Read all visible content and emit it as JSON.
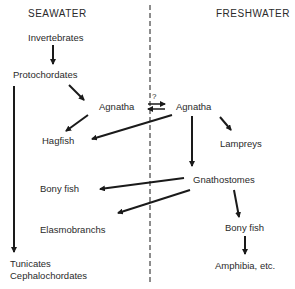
{
  "headers": {
    "left": "SEAWATER",
    "right": "FRESHWATER"
  },
  "nodes": {
    "invertebrates": "Invertebrates",
    "protochordates": "Protochordates",
    "agnatha_sea": "Agnatha",
    "agnatha_fresh": "Agnatha",
    "question": "?",
    "hagfish": "Hagfish",
    "lampreys": "Lampreys",
    "gnathostomes": "Gnathostomes",
    "bony_fish_sea": "Bony fish",
    "elasmobranchs": "Elasmobranchs",
    "bony_fish_fresh": "Bony fish",
    "amphibia": "Amphibia, etc.",
    "tunicates": "Tunicates",
    "cephalochordates": "Cephalochordates"
  },
  "edges": [
    {
      "from": "Invertebrates",
      "to": "Protochordates"
    },
    {
      "from": "Protochordates",
      "to": "Agnatha (seawater)"
    },
    {
      "from": "Protochordates",
      "to": "Tunicates / Cephalochordates"
    },
    {
      "from": "Agnatha (seawater)",
      "to": "Agnatha (freshwater)",
      "bidirectional": true,
      "label": "?"
    },
    {
      "from": "Agnatha (seawater)",
      "to": "Hagfish"
    },
    {
      "from": "Agnatha (freshwater)",
      "to": "Hagfish"
    },
    {
      "from": "Agnatha (freshwater)",
      "to": "Lampreys"
    },
    {
      "from": "Agnatha (freshwater)",
      "to": "Gnathostomes"
    },
    {
      "from": "Gnathostomes",
      "to": "Bony fish (seawater)"
    },
    {
      "from": "Gnathostomes",
      "to": "Elasmobranchs"
    },
    {
      "from": "Gnathostomes",
      "to": "Bony fish (freshwater)"
    },
    {
      "from": "Bony fish (freshwater)",
      "to": "Amphibia, etc."
    }
  ],
  "colors": {
    "ink": "#1a1a1a",
    "text": "#2a2a2a",
    "background": "#ffffff"
  }
}
